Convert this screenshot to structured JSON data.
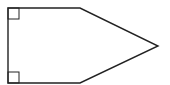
{
  "diagram": {
    "type": "pentagon",
    "stroke_color": "#222222",
    "fill_color": "#ffffff",
    "vertices": [
      [
        8,
        8
      ],
      [
        80,
        8
      ],
      [
        158,
        46
      ],
      [
        80,
        83
      ],
      [
        8,
        83
      ]
    ],
    "right_angle_markers": [
      {
        "corner": "top-left",
        "x": 8,
        "y": 8,
        "size": 11
      },
      {
        "corner": "bottom-left",
        "x": 8,
        "y": 72,
        "size": 11
      }
    ]
  }
}
